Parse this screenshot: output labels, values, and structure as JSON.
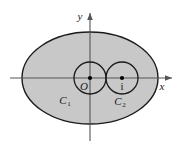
{
  "figure": {
    "name": "complex-plane-region-diagram",
    "background_color": "#ffffff",
    "stroke_color": "#1a1a1a",
    "region_fill_color": "#c8c8c8",
    "axis_color": "#555555",
    "axes": {
      "x_label": "x",
      "y_label": "y",
      "x_axis_name": "horizontal-real-axis",
      "y_axis_name": "vertical-imaginary-axis"
    },
    "shapes": {
      "outer_ellipse": {
        "name": "outer-boundary-ellipse",
        "cx": 90,
        "cy": 78,
        "rx": 68,
        "ry": 46,
        "filled": true
      },
      "inner_circle_1": {
        "name": "inner-circle-c1",
        "cx": 90,
        "cy": 78,
        "r": 16,
        "filled": false,
        "label": "C",
        "subscript": "1",
        "center_label": "O"
      },
      "inner_circle_2": {
        "name": "inner-circle-c2",
        "cx": 122,
        "cy": 78,
        "r": 16,
        "filled": false,
        "label": "C",
        "subscript": "2",
        "center_label": "i"
      }
    }
  }
}
